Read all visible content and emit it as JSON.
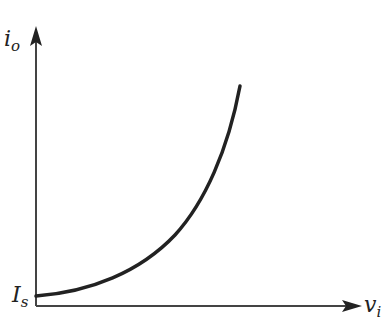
{
  "diagram": {
    "type": "exponential-curve",
    "y_axis": {
      "label": "i",
      "label_sub": "o"
    },
    "x_axis": {
      "label": "v",
      "label_sub": "i"
    },
    "intercept_label": {
      "main": "I",
      "sub": "s"
    },
    "colors": {
      "stroke": "#222222",
      "background": "#ffffff"
    }
  }
}
